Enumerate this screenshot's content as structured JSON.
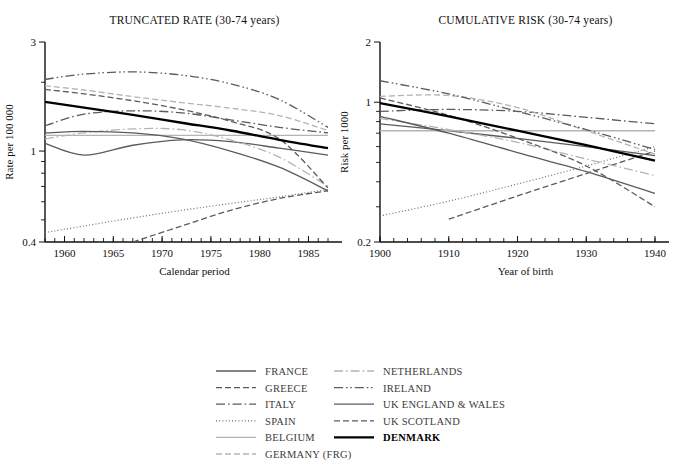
{
  "figure": {
    "background": "#ffffff",
    "panels": [
      {
        "id": "truncated-rate",
        "title": "TRUNCATED RATE (30-74 years)",
        "xlabel": "Calendar period",
        "ylabel": "Rate per 100 000"
      },
      {
        "id": "cumulative-risk",
        "title": "CUMULATIVE RISK (30-74 years)",
        "xlabel": "Year of birth",
        "ylabel": "Risk per 1000"
      }
    ]
  },
  "legend": {
    "columns": [
      [
        {
          "label": "FRANCE",
          "key": "FRANCE",
          "color": "#5b5b5b",
          "dash": "none",
          "width": 1.3
        },
        {
          "label": "GREECE",
          "key": "GREECE",
          "color": "#5b5b5b",
          "dash": "dashed",
          "width": 1.3
        },
        {
          "label": "ITALY",
          "key": "ITALY",
          "color": "#5b5b5b",
          "dash": "dashdot",
          "width": 1.3
        },
        {
          "label": "SPAIN",
          "key": "SPAIN",
          "color": "#6e6e6e",
          "dash": "dotted",
          "width": 1.2
        },
        {
          "label": "BELGIUM",
          "key": "BELGIUM",
          "color": "#b4b4b4",
          "dash": "none",
          "width": 1.3
        },
        {
          "label": "GERMANY (FRG)",
          "key": "GERMANY (FRG)",
          "color": "#b4b4b4",
          "dash": "dashed",
          "width": 1.3
        }
      ],
      [
        {
          "label": "NETHERLANDS",
          "key": "NETHERLANDS",
          "color": "#b4b4b4",
          "dash": "dashdot",
          "width": 1.3
        },
        {
          "label": "IRELAND",
          "key": "IRELAND",
          "color": "#5b5b5b",
          "dash": "dashdotdot",
          "width": 1.3
        },
        {
          "label": "UK ENGLAND & WALES",
          "key": "UK ENGLAND & WALES",
          "color": "#5b5b5b",
          "dash": "none",
          "width": 1.3
        },
        {
          "label": "UK SCOTLAND",
          "key": "UK SCOTLAND",
          "color": "#5b5b5b",
          "dash": "dashed",
          "width": 1.3
        },
        {
          "label": "DENMARK",
          "key": "DENMARK",
          "color": "#000000",
          "dash": "none",
          "width": 2.3
        }
      ]
    ]
  },
  "chart_data": [
    {
      "type": "line",
      "id": "truncated-rate",
      "title": "TRUNCATED RATE (30-74 years)",
      "xlabel": "Calendar period",
      "ylabel": "Rate per 100 000",
      "yscale": "log",
      "ylim": [
        0.4,
        3
      ],
      "yticks": [
        1
      ],
      "yticklabels": [
        "0.4",
        "1",
        "3"
      ],
      "ytick_ends": [
        "0.4",
        "3"
      ],
      "xlim": [
        1958,
        1987
      ],
      "xticks": [
        1960,
        1965,
        1970,
        1975,
        1980,
        1985
      ],
      "xticks_minor_step": 1,
      "grid": false,
      "legend_position": "below",
      "x": [
        1958,
        1962,
        1967,
        1972,
        1977,
        1982,
        1987
      ],
      "series": [
        {
          "name": "FRANCE",
          "values": [
            1.08,
            0.96,
            1.06,
            1.12,
            1.1,
            1.03,
            0.96
          ]
        },
        {
          "name": "GREECE",
          "values": [
            null,
            null,
            0.4,
            0.47,
            0.55,
            0.62,
            0.67
          ]
        },
        {
          "name": "ITALY",
          "values": [
            1.29,
            1.45,
            1.5,
            1.47,
            1.37,
            1.27,
            1.2
          ]
        },
        {
          "name": "SPAIN",
          "values": [
            0.44,
            0.47,
            0.51,
            0.55,
            0.59,
            0.63,
            0.68
          ]
        },
        {
          "name": "BELGIUM",
          "values": [
            1.17,
            1.17,
            1.17,
            1.17,
            1.17,
            1.17,
            1.17
          ]
        },
        {
          "name": "GERMANY (FRG)",
          "values": [
            1.93,
            1.85,
            1.73,
            1.63,
            1.54,
            1.43,
            1.23
          ]
        },
        {
          "name": "NETHERLANDS",
          "values": [
            1.13,
            1.2,
            1.25,
            1.24,
            1.12,
            0.94,
            0.7
          ]
        },
        {
          "name": "IRELAND",
          "values": [
            2.06,
            2.17,
            2.22,
            2.15,
            1.97,
            1.68,
            1.27
          ]
        },
        {
          "name": "UK ENGLAND & WALES",
          "values": [
            1.2,
            1.22,
            1.2,
            1.13,
            1.0,
            0.85,
            0.67
          ]
        },
        {
          "name": "UK SCOTLAND",
          "values": [
            1.86,
            1.78,
            1.66,
            1.52,
            1.35,
            1.13,
            0.69
          ]
        },
        {
          "name": "DENMARK",
          "values": [
            1.64,
            1.55,
            1.44,
            1.33,
            1.23,
            1.12,
            1.03
          ]
        }
      ]
    },
    {
      "type": "line",
      "id": "cumulative-risk",
      "title": "CUMULATIVE RISK (30-74 years)",
      "xlabel": "Year of birth",
      "ylabel": "Risk per 1000",
      "yscale": "log",
      "ylim": [
        0.2,
        2
      ],
      "yticks": [
        1
      ],
      "yticklabels": [
        "0.2",
        "1",
        "2"
      ],
      "ytick_ends": [
        "0.2",
        "2"
      ],
      "xlim": [
        1900,
        1940
      ],
      "xticks": [
        1900,
        1910,
        1920,
        1930,
        1940
      ],
      "xticks_minor_step": 2,
      "grid": false,
      "legend_position": "below",
      "x": [
        1900,
        1910,
        1920,
        1930,
        1940
      ],
      "series": [
        {
          "name": "FRANCE",
          "values": [
            0.78,
            0.72,
            0.66,
            0.6,
            0.54
          ]
        },
        {
          "name": "GREECE",
          "values": [
            null,
            0.26,
            0.34,
            0.44,
            0.57
          ]
        },
        {
          "name": "ITALY",
          "values": [
            0.9,
            0.92,
            0.9,
            0.84,
            0.78
          ]
        },
        {
          "name": "SPAIN",
          "values": [
            0.27,
            0.32,
            0.39,
            0.48,
            0.6
          ]
        },
        {
          "name": "BELGIUM",
          "values": [
            0.72,
            0.72,
            0.72,
            0.72,
            0.72
          ]
        },
        {
          "name": "GERMANY (FRG)",
          "values": [
            1.07,
            1.08,
            0.94,
            0.72,
            0.55
          ]
        },
        {
          "name": "NETHERLANDS",
          "values": [
            0.83,
            0.73,
            0.63,
            0.52,
            0.43
          ]
        },
        {
          "name": "IRELAND",
          "values": [
            1.28,
            1.1,
            0.9,
            0.73,
            0.58
          ]
        },
        {
          "name": "UK ENGLAND & WALES",
          "values": [
            0.85,
            0.7,
            0.56,
            0.45,
            0.35
          ]
        },
        {
          "name": "UK SCOTLAND",
          "values": [
            1.05,
            0.86,
            0.66,
            0.48,
            0.3
          ]
        },
        {
          "name": "DENMARK",
          "values": [
            0.99,
            0.85,
            0.72,
            0.61,
            0.51
          ]
        }
      ]
    }
  ]
}
